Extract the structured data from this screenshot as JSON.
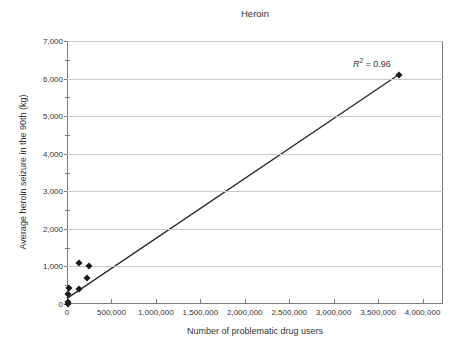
{
  "chart_data": {
    "type": "scatter",
    "title": "Heroin",
    "xlabel": "Number of problematic drug users",
    "ylabel": "Average heroin seizure in the 90th (kg)",
    "xlim": [
      0,
      4230000
    ],
    "ylim": [
      0,
      7000
    ],
    "grid": "horizontal-only",
    "legend": "none",
    "x_tick_values": [
      0,
      500000,
      1000000,
      1500000,
      2000000,
      2500000,
      3000000,
      3500000,
      4000000
    ],
    "x_tick_labels": [
      "0",
      "500,000",
      "1,000,000",
      "1,500,000",
      "2,000,000",
      "2,500,000",
      "3,000,000",
      "3,500,000",
      "4,000,000"
    ],
    "y_tick_values": [
      0,
      1000,
      2000,
      3000,
      4000,
      5000,
      6000,
      7000
    ],
    "y_tick_labels": [
      "0",
      "1,000",
      "2,000",
      "3,000",
      "4,000",
      "5,000",
      "6,000",
      "7,000"
    ],
    "y_minor_tick_values": [
      500,
      1500,
      2500,
      3500,
      4500,
      5500,
      6500
    ],
    "points": [
      [
        10000,
        0
      ],
      [
        12000,
        60
      ],
      [
        15000,
        260
      ],
      [
        25000,
        430
      ],
      [
        130000,
        1090
      ],
      [
        140000,
        410
      ],
      [
        220000,
        680
      ],
      [
        250000,
        1020
      ],
      [
        3730000,
        6100
      ]
    ],
    "trendline": {
      "x1": 0,
      "y1": 150,
      "x2": 3730000,
      "y2": 6100
    },
    "annotation": {
      "r_var": "R",
      "r_sup": "2",
      "r_rest": " = 0.96",
      "x": 3430000,
      "y": 6420
    },
    "colors": {
      "point": "#1a1a1a",
      "trendline": "#262626",
      "grid": "#c9c9c9",
      "axis": "#7a7a7a",
      "text": "#333333",
      "background": "#ffffff"
    }
  }
}
